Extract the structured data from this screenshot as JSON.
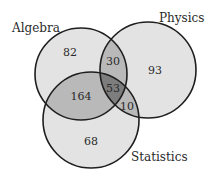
{
  "diagram": {
    "type": "venn3",
    "sets": [
      {
        "name": "Algebra",
        "label_x": 12,
        "label_y": 32
      },
      {
        "name": "Physics",
        "label_x": 159,
        "label_y": 22
      },
      {
        "name": "Statistics",
        "label_x": 131,
        "label_y": 161
      }
    ],
    "regions": {
      "algebra_only": "82",
      "physics_only": "93",
      "statistics_only": "68",
      "algebra_physics": "30",
      "algebra_statistics": "164",
      "physics_statistics": "10",
      "all_three": "53"
    },
    "colors": {
      "single": "#e3e3e3",
      "double": "#b9b9b9",
      "triple": "#7d7d7d",
      "stroke": "#1e1e1e"
    }
  }
}
